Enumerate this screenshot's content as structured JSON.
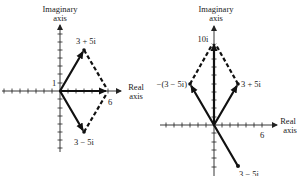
{
  "left_diagram": {
    "title": "Complex addition: (3+5i) + (3-5i) = 6",
    "y_axis_label_line1": "Imaginary",
    "y_axis_label_line2": "axis",
    "x_axis_label_line1": "Real",
    "x_axis_label_line2": "axis",
    "tick_label_y": "1",
    "tick_label_x": "6",
    "points": [
      {
        "label": "3 + 5i",
        "re": 3,
        "im": 5
      },
      {
        "label": "3 − 5i",
        "re": 3,
        "im": -5
      },
      {
        "label": "6",
        "re": 6,
        "im": 0
      }
    ],
    "label_top": "3 + 5i",
    "label_bottom": "3 − 5i"
  },
  "right_diagram": {
    "title": "Complex subtraction: (3+5i) − (3−5i) = 10i",
    "y_axis_label_line1": "Imaginary",
    "y_axis_label_line2": "axis",
    "x_axis_label_line1": "Real",
    "x_axis_label_line2": "axis",
    "tick_label_y": "10i",
    "tick_label_x": "6",
    "points": [
      {
        "label": "3 + 5i",
        "re": 3,
        "im": 5
      },
      {
        "label": "−(3 − 5i)",
        "re": -3,
        "im": 5
      },
      {
        "label": "3 − 5i",
        "re": 3,
        "im": -5
      },
      {
        "label": "10i",
        "re": 0,
        "im": 10
      }
    ],
    "label_right": "3 + 5i",
    "label_left": "−(3 − 5i)",
    "label_bottom": "3 − 5i"
  },
  "colors": {
    "ink": "#111111",
    "background": "#ffffff"
  }
}
